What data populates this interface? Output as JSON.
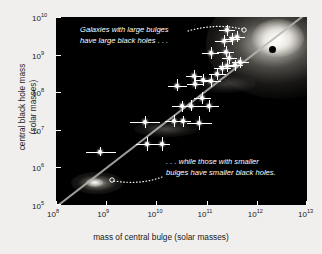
{
  "chart_data": {
    "type": "scatter",
    "title": "",
    "xlabel": "mass of central bulge (solar masses)",
    "ylabel_line1": "central black hole mass",
    "ylabel_line2": "(solar masses)",
    "xlim": [
      100000000.0,
      10000000000000.0
    ],
    "ylim": [
      100000.0,
      10000000000.0
    ],
    "xscale": "log",
    "yscale": "log",
    "xticks": [
      "10^8",
      "10^9",
      "10^10",
      "10^11",
      "10^12",
      "10^13"
    ],
    "xtick_labels": [
      {
        "mantissa": "10",
        "exp": "8"
      },
      {
        "mantissa": "10",
        "exp": "9"
      },
      {
        "mantissa": "10",
        "exp": "10"
      },
      {
        "mantissa": "10",
        "exp": "11"
      },
      {
        "mantissa": "10",
        "exp": "12"
      },
      {
        "mantissa": "10",
        "exp": "13"
      }
    ],
    "yticks": [
      "10^10",
      "10^9",
      "10^8",
      "10^7",
      "10^6",
      "10^5"
    ],
    "ytick_labels": [
      {
        "mantissa": "10",
        "exp": "10"
      },
      {
        "mantissa": "10",
        "exp": "9"
      },
      {
        "mantissa": "10",
        "exp": "8"
      },
      {
        "mantissa": "10",
        "exp": "7"
      },
      {
        "mantissa": "10",
        "exp": "6"
      },
      {
        "mantissa": "10",
        "exp": "5"
      }
    ],
    "grid": false,
    "legend": "none",
    "background": "#000000",
    "marker_color": "#ffffff",
    "fit_line": {
      "description": "linear relation on log-log axes",
      "x": [
        100000000.0,
        10000000000000.0
      ],
      "y": [
        200000.0,
        11000000000.0
      ]
    },
    "points": [
      {
        "x": 750000000.0,
        "y": 2600000.0,
        "xerr_lo": 400000000.0,
        "xerr_hi": 1600000000.0,
        "yerr_lo": 2000000.0,
        "yerr_hi": 3400000.0
      },
      {
        "x": 6500000000.0,
        "y": 4100000.0,
        "xerr_lo": 4000000000.0,
        "xerr_hi": 11000000000.0,
        "yerr_lo": 2700000.0,
        "yerr_hi": 6300000.0
      },
      {
        "x": 13000000000.0,
        "y": 4200000.0,
        "xerr_lo": 9000000000.0,
        "xerr_hi": 19000000000.0,
        "yerr_lo": 2800000.0,
        "yerr_hi": 6400000.0
      },
      {
        "x": 6000000000.0,
        "y": 16000000.0,
        "xerr_lo": 3000000000.0,
        "xerr_hi": 12000000000.0,
        "yerr_lo": 11000000.0,
        "yerr_hi": 24000000.0
      },
      {
        "x": 22000000000.0,
        "y": 17000000.0,
        "xerr_lo": 15000000000.0,
        "xerr_hi": 33000000000.0,
        "yerr_lo": 12000000.0,
        "yerr_hi": 25000000.0
      },
      {
        "x": 34000000000.0,
        "y": 17000000.0,
        "xerr_lo": 24000000000.0,
        "xerr_hi": 50000000000.0,
        "yerr_lo": 12000000.0,
        "yerr_hi": 24000000.0
      },
      {
        "x": 70000000000.0,
        "y": 15000000.0,
        "xerr_lo": 40000000000.0,
        "xerr_hi": 130000000000.0,
        "yerr_lo": 10000000.0,
        "yerr_hi": 23000000.0
      },
      {
        "x": 32000000000.0,
        "y": 42000000.0,
        "xerr_lo": 20000000000.0,
        "xerr_hi": 52000000000.0,
        "yerr_lo": 30000000.0,
        "yerr_hi": 60000000.0
      },
      {
        "x": 50000000000.0,
        "y": 44000000.0,
        "xerr_lo": 34000000000.0,
        "xerr_hi": 75000000000.0,
        "yerr_lo": 31000000.0,
        "yerr_hi": 63000000.0
      },
      {
        "x": 110000000000.0,
        "y": 43000000.0,
        "xerr_lo": 70000000000.0,
        "xerr_hi": 180000000000.0,
        "yerr_lo": 30000000.0,
        "yerr_hi": 62000000.0
      },
      {
        "x": 80000000000.0,
        "y": 70000000.0,
        "xerr_lo": 55000000000.0,
        "xerr_hi": 120000000000.0,
        "yerr_lo": 50000000.0,
        "yerr_hi": 100000000.0
      },
      {
        "x": 26000000000.0,
        "y": 150000000.0,
        "xerr_lo": 17000000000.0,
        "xerr_hi": 40000000000.0,
        "yerr_lo": 110000000.0,
        "yerr_hi": 220000000.0
      },
      {
        "x": 60000000000.0,
        "y": 170000000.0,
        "xerr_lo": 40000000000.0,
        "xerr_hi": 90000000000.0,
        "yerr_lo": 120000000.0,
        "yerr_hi": 250000000.0
      },
      {
        "x": 85000000000.0,
        "y": 210000000.0,
        "xerr_lo": 60000000000.0,
        "xerr_hi": 130000000000.0,
        "yerr_lo": 150000000.0,
        "yerr_hi": 300000000.0
      },
      {
        "x": 120000000000.0,
        "y": 200000000.0,
        "xerr_lo": 80000000000.0,
        "xerr_hi": 190000000000.0,
        "yerr_lo": 140000000.0,
        "yerr_hi": 290000000.0
      },
      {
        "x": 55000000000.0,
        "y": 270000000.0,
        "xerr_lo": 38000000000.0,
        "xerr_hi": 80000000000.0,
        "yerr_lo": 190000000.0,
        "yerr_hi": 390000000.0
      },
      {
        "x": 160000000000.0,
        "y": 300000000.0,
        "xerr_lo": 110000000000.0,
        "xerr_hi": 240000000000.0,
        "yerr_lo": 210000000.0,
        "yerr_hi": 430000000.0
      },
      {
        "x": 200000000000.0,
        "y": 440000000.0,
        "xerr_lo": 140000000000.0,
        "xerr_hi": 300000000000.0,
        "yerr_lo": 310000000.0,
        "yerr_hi": 630000000.0
      },
      {
        "x": 260000000000.0,
        "y": 500000000.0,
        "xerr_lo": 180000000000.0,
        "xerr_hi": 380000000000.0,
        "yerr_lo": 350000000.0,
        "yerr_hi": 720000000.0
      },
      {
        "x": 360000000000.0,
        "y": 520000000.0,
        "xerr_lo": 260000000000.0,
        "xerr_hi": 520000000000.0,
        "yerr_lo": 370000000.0,
        "yerr_hi": 740000000.0
      },
      {
        "x": 460000000000.0,
        "y": 620000000.0,
        "xerr_lo": 320000000000.0,
        "xerr_hi": 700000000000.0,
        "yerr_lo": 440000000.0,
        "yerr_hi": 880000000.0
      },
      {
        "x": 280000000000.0,
        "y": 800000000.0,
        "xerr_lo": 200000000000.0,
        "xerr_hi": 400000000000.0,
        "yerr_lo": 560000000.0,
        "yerr_hi": 1100000000.0
      },
      {
        "x": 120000000000.0,
        "y": 1100000000.0,
        "xerr_lo": 80000000000.0,
        "xerr_hi": 180000000000.0,
        "yerr_lo": 780000000.0,
        "yerr_hi": 1600000000.0
      },
      {
        "x": 240000000000.0,
        "y": 1200000000.0,
        "xerr_lo": 160000000000.0,
        "xerr_hi": 350000000000.0,
        "yerr_lo": 850000000.0,
        "yerr_hi": 1700000000.0
      },
      {
        "x": 220000000000.0,
        "y": 2300000000.0,
        "xerr_lo": 150000000000.0,
        "xerr_hi": 320000000000.0,
        "yerr_lo": 1600000000.0,
        "yerr_hi": 3300000000.0
      },
      {
        "x": 320000000000.0,
        "y": 2600000000.0,
        "xerr_lo": 220000000000.0,
        "xerr_hi": 460000000000.0,
        "yerr_lo": 1800000000.0,
        "yerr_hi": 3700000000.0
      },
      {
        "x": 400000000000.0,
        "y": 3000000000.0,
        "xerr_lo": 280000000000.0,
        "xerr_hi": 580000000000.0,
        "yerr_lo": 2100000000.0,
        "yerr_hi": 4300000000.0
      },
      {
        "x": 260000000000.0,
        "y": 4400000000.0,
        "xerr_lo": 180000000000.0,
        "xerr_hi": 370000000000.0,
        "yerr_lo": 3100000000.0,
        "yerr_hi": 6200000000.0
      }
    ],
    "annotations": [
      {
        "name": "large-bulges-note",
        "line1": "Galaxies with large bulges",
        "line2": "have large black holes . . .",
        "points_to": "bright-elliptical-galaxy"
      },
      {
        "name": "small-bulges-note",
        "line1": ". . . while those with smaller",
        "line2": "bulges have smaller black holes.",
        "points_to": "small-dim-galaxy"
      }
    ],
    "illustrations": [
      {
        "name": "bright-elliptical-galaxy",
        "note": "large glowing galaxy, upper right"
      },
      {
        "name": "black-hole-dot",
        "note": "dark dot inside bright galaxy"
      },
      {
        "name": "small-dim-galaxy",
        "note": "faint small galaxy, lower left"
      }
    ]
  }
}
